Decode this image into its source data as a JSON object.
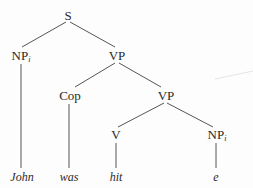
{
  "diagram": {
    "type": "syntax-tree",
    "nodes": {
      "s": {
        "label": "S"
      },
      "np_subject": {
        "label": "NP",
        "index": "i"
      },
      "vp_top": {
        "label": "VP"
      },
      "cop": {
        "label": "Cop"
      },
      "vp_lower": {
        "label": "VP"
      },
      "v": {
        "label": "V"
      },
      "np_object": {
        "label": "NP",
        "index": "i"
      }
    },
    "leaves": {
      "john": "John",
      "was": "was",
      "hit": "hit",
      "e": "e"
    },
    "edges": [
      [
        "S",
        "NP_i"
      ],
      [
        "S",
        "VP"
      ],
      [
        "VP",
        "Cop"
      ],
      [
        "VP",
        "VP"
      ],
      [
        "VP",
        "V"
      ],
      [
        "VP",
        "NP_i"
      ],
      [
        "NP_i",
        "John"
      ],
      [
        "Cop",
        "was"
      ],
      [
        "V",
        "hit"
      ],
      [
        "NP_i",
        "e"
      ]
    ]
  }
}
